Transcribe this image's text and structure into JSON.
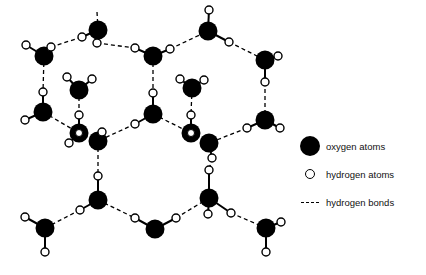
{
  "diagram": {
    "colors": {
      "oxygen": "#000000",
      "hydrogen_fill": "#ffffff",
      "stroke": "#000000"
    },
    "oxygen_atoms": [
      {
        "id": "O1",
        "x": 98,
        "y": 30
      },
      {
        "id": "O2",
        "x": 44,
        "y": 56
      },
      {
        "id": "O3",
        "x": 153,
        "y": 56
      },
      {
        "id": "O4",
        "x": 208,
        "y": 31
      },
      {
        "id": "O5",
        "x": 265,
        "y": 60
      },
      {
        "id": "O6",
        "x": 79,
        "y": 90
      },
      {
        "id": "O7",
        "x": 192,
        "y": 88
      },
      {
        "id": "O8",
        "x": 43,
        "y": 112
      },
      {
        "id": "O9",
        "x": 153,
        "y": 114
      },
      {
        "id": "O10",
        "x": 265,
        "y": 120
      },
      {
        "id": "O11",
        "x": 98,
        "y": 141
      },
      {
        "id": "O12",
        "x": 209,
        "y": 143
      },
      {
        "id": "O13",
        "x": 98,
        "y": 200
      },
      {
        "id": "O14",
        "x": 45,
        "y": 228
      },
      {
        "id": "O15",
        "x": 155,
        "y": 229
      },
      {
        "id": "O16",
        "x": 209,
        "y": 198
      },
      {
        "id": "O17",
        "x": 266,
        "y": 228
      }
    ],
    "ring_oxygen_atoms": [
      {
        "id": "R1",
        "x": 79,
        "y": 133
      },
      {
        "id": "R2",
        "x": 191,
        "y": 133
      }
    ],
    "hydrogen_atoms": [
      {
        "x": 97,
        "y": 43
      },
      {
        "x": 82,
        "y": 37
      },
      {
        "x": 26,
        "y": 45
      },
      {
        "x": 51,
        "y": 47
      },
      {
        "x": 135,
        "y": 48
      },
      {
        "x": 170,
        "y": 49
      },
      {
        "x": 209,
        "y": 10
      },
      {
        "x": 229,
        "y": 42
      },
      {
        "x": 278,
        "y": 56
      },
      {
        "x": 265,
        "y": 82
      },
      {
        "x": 67,
        "y": 77
      },
      {
        "x": 92,
        "y": 79
      },
      {
        "x": 180,
        "y": 79
      },
      {
        "x": 204,
        "y": 80
      },
      {
        "x": 43,
        "y": 92
      },
      {
        "x": 25,
        "y": 120
      },
      {
        "x": 153,
        "y": 93
      },
      {
        "x": 135,
        "y": 124
      },
      {
        "x": 247,
        "y": 128
      },
      {
        "x": 280,
        "y": 128
      },
      {
        "x": 79,
        "y": 115
      },
      {
        "x": 102,
        "y": 132
      },
      {
        "x": 69,
        "y": 143
      },
      {
        "x": 191,
        "y": 115
      },
      {
        "x": 212,
        "y": 158
      },
      {
        "x": 98,
        "y": 176
      },
      {
        "x": 80,
        "y": 210
      },
      {
        "x": 25,
        "y": 217
      },
      {
        "x": 45,
        "y": 252
      },
      {
        "x": 135,
        "y": 218
      },
      {
        "x": 176,
        "y": 218
      },
      {
        "x": 209,
        "y": 170
      },
      {
        "x": 208,
        "y": 214
      },
      {
        "x": 231,
        "y": 213
      },
      {
        "x": 281,
        "y": 222
      },
      {
        "x": 266,
        "y": 252
      }
    ],
    "covalent_bonds": [
      [
        98,
        30,
        97,
        43
      ],
      [
        98,
        30,
        82,
        37
      ],
      [
        44,
        56,
        26,
        45
      ],
      [
        44,
        56,
        51,
        47
      ],
      [
        153,
        56,
        135,
        48
      ],
      [
        153,
        56,
        170,
        49
      ],
      [
        208,
        31,
        209,
        10
      ],
      [
        208,
        31,
        229,
        42
      ],
      [
        265,
        60,
        278,
        56
      ],
      [
        265,
        60,
        265,
        82
      ],
      [
        79,
        90,
        67,
        77
      ],
      [
        79,
        90,
        92,
        79
      ],
      [
        192,
        88,
        180,
        79
      ],
      [
        192,
        88,
        204,
        80
      ],
      [
        43,
        112,
        43,
        92
      ],
      [
        43,
        112,
        25,
        120
      ],
      [
        153,
        114,
        153,
        93
      ],
      [
        153,
        114,
        135,
        124
      ],
      [
        265,
        120,
        247,
        128
      ],
      [
        265,
        120,
        280,
        128
      ],
      [
        79,
        133,
        79,
        115
      ],
      [
        79,
        133,
        69,
        143
      ],
      [
        98,
        141,
        102,
        132
      ],
      [
        191,
        133,
        191,
        115
      ],
      [
        209,
        143,
        212,
        158
      ],
      [
        98,
        200,
        98,
        176
      ],
      [
        98,
        200,
        80,
        210
      ],
      [
        45,
        228,
        25,
        217
      ],
      [
        45,
        228,
        45,
        252
      ],
      [
        155,
        229,
        135,
        218
      ],
      [
        155,
        229,
        176,
        218
      ],
      [
        209,
        198,
        209,
        170
      ],
      [
        209,
        198,
        208,
        214
      ],
      [
        209,
        198,
        231,
        213
      ],
      [
        266,
        228,
        281,
        222
      ],
      [
        266,
        228,
        266,
        252
      ]
    ],
    "hydrogen_bonds": [
      [
        97,
        12,
        98,
        30
      ],
      [
        51,
        47,
        82,
        37
      ],
      [
        97,
        43,
        135,
        48
      ],
      [
        170,
        49,
        208,
        31
      ],
      [
        229,
        42,
        265,
        60
      ],
      [
        44,
        56,
        43,
        92
      ],
      [
        153,
        56,
        153,
        93
      ],
      [
        265,
        82,
        265,
        120
      ],
      [
        79,
        90,
        79,
        115
      ],
      [
        192,
        88,
        191,
        115
      ],
      [
        43,
        112,
        79,
        133
      ],
      [
        135,
        124,
        98,
        141
      ],
      [
        153,
        114,
        191,
        133
      ],
      [
        247,
        128,
        209,
        143
      ],
      [
        98,
        141,
        98,
        176
      ],
      [
        212,
        158,
        209,
        170
      ],
      [
        80,
        210,
        45,
        228
      ],
      [
        98,
        200,
        135,
        218
      ],
      [
        176,
        218,
        209,
        198
      ],
      [
        231,
        213,
        266,
        228
      ]
    ]
  },
  "legend": {
    "items": [
      {
        "symbol": "oxygen",
        "label": "oxygen atoms"
      },
      {
        "symbol": "hydrogen",
        "label": "hydrogen atoms"
      },
      {
        "symbol": "bond",
        "label": "hydrogen bonds"
      }
    ]
  }
}
